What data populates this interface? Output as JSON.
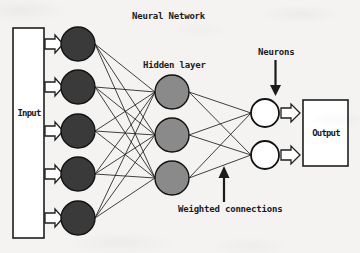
{
  "diagram": {
    "title": "Neural Network",
    "type": "neural-network-architecture",
    "background_color": "#f4f3f1",
    "stroke_color": "#1b1b1b",
    "labels": {
      "title": "Neural Network",
      "input": "Input",
      "output": "Output",
      "hidden_layer": "Hidden layer",
      "neurons": "Neurons",
      "weighted_connections": "Weighted connections"
    },
    "layers": [
      {
        "name": "input-layer",
        "node_count": 5,
        "fill_color": "#3a3a3a",
        "radius": 17,
        "cx": 78,
        "cy": [
          44,
          87,
          131,
          174,
          218
        ]
      },
      {
        "name": "hidden-layer",
        "node_count": 3,
        "fill_color": "#8a8a8a",
        "radius": 17,
        "cx": 172,
        "cy": [
          92,
          135,
          178
        ]
      },
      {
        "name": "output-neuron-layer",
        "node_count": 2,
        "fill_color": "#ffffff",
        "radius": 14,
        "cx": 265,
        "cy": [
          113,
          155
        ]
      }
    ],
    "boxes": [
      {
        "name": "input-box",
        "label": "Input",
        "x": 13,
        "y": 28,
        "width": 31,
        "height": 210,
        "fill_color": "#ffffff"
      },
      {
        "name": "output-box",
        "label": "Output",
        "x": 303,
        "y": 100,
        "width": 45,
        "height": 66,
        "fill_color": "#ffffff"
      }
    ],
    "block_arrows": {
      "input_arrow_count": 5,
      "output_arrow_count": 2,
      "style": "hollow-block-arrow"
    },
    "annotation_arrows": [
      {
        "name": "neurons-pointer",
        "direction": "down",
        "x": 276,
        "from_y": 60,
        "to_y": 94
      },
      {
        "name": "weighted-connections-pointer",
        "direction": "up",
        "x": 224,
        "from_y": 200,
        "to_y": 167
      }
    ]
  }
}
